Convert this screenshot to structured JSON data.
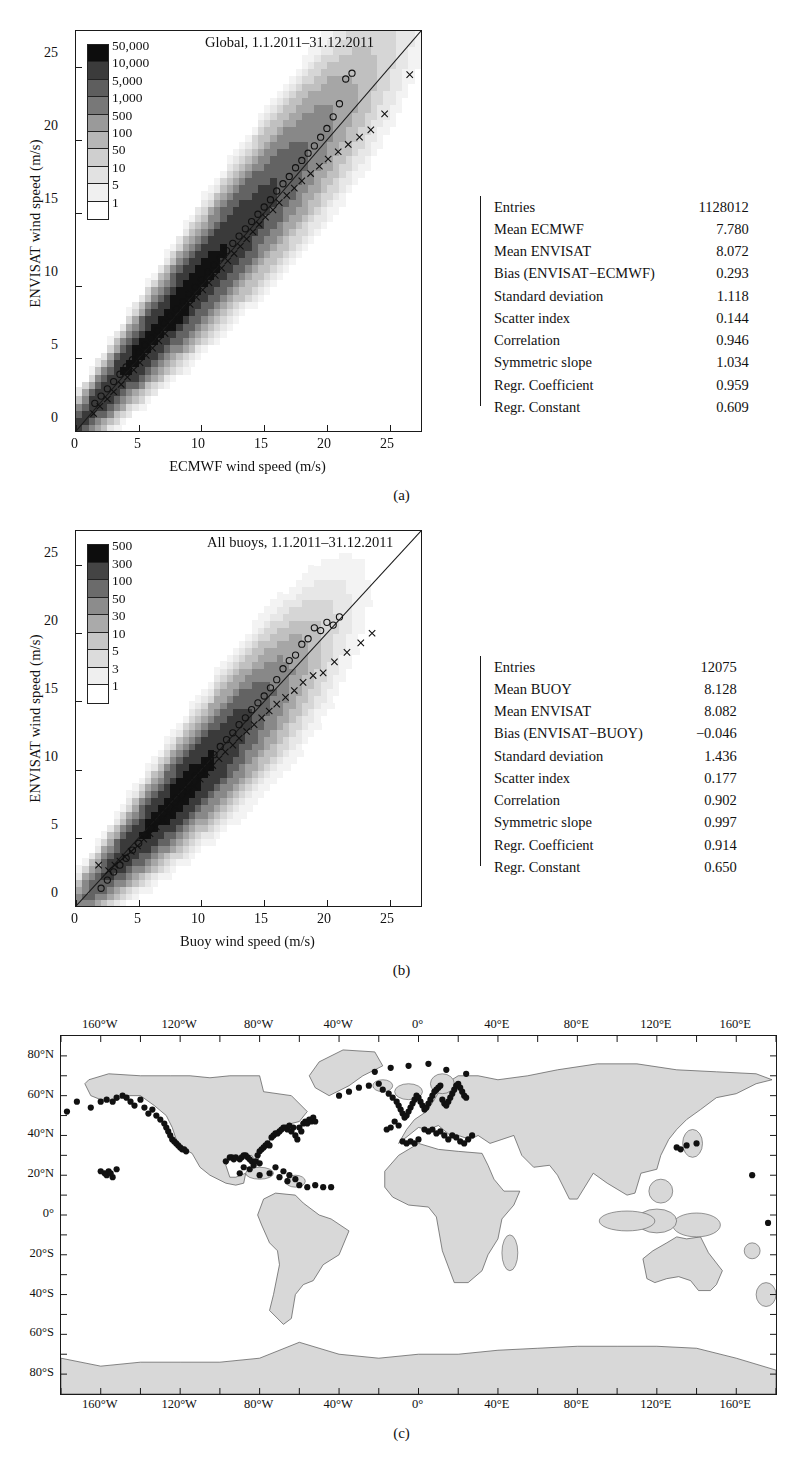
{
  "figure": {
    "panels": [
      "(a)",
      "(b)",
      "(c)"
    ]
  },
  "panel_a": {
    "caption": "(a)",
    "chart_data": {
      "type": "heatmap",
      "title": "Global, 1.1.2011–31.12.2011",
      "xlabel": "ECMWF wind speed (m/s)",
      "ylabel": "ENVISAT wind speed (m/s)",
      "xlim": [
        0,
        27.5
      ],
      "ylim": [
        0,
        27.5
      ],
      "xticks": [
        0,
        5,
        10,
        15,
        20,
        25
      ],
      "yticks": [
        0,
        5,
        10,
        15,
        20,
        25
      ],
      "grid": false,
      "colorbar": {
        "labels": [
          "50,000",
          "10,000",
          "5,000",
          "1,000",
          "500",
          "100",
          "50",
          "10",
          "5",
          "1"
        ],
        "colors": [
          "#0d0d0d",
          "#3b3b3b",
          "#5e5e5e",
          "#787878",
          "#9a9a9a",
          "#b6b6b6",
          "#cfcfcf",
          "#e2e2e2",
          "#f0f0f0",
          "#ffffff"
        ]
      },
      "reference_line": "1:1 diagonal",
      "series": [
        {
          "name": "Mean ENVISAT per ECMWF bin (open circles)",
          "marker": "circle",
          "x": [
            1.5,
            2.0,
            2.5,
            3.0,
            3.5,
            4.0,
            4.5,
            5.0,
            5.5,
            6.0,
            6.5,
            7.0,
            7.5,
            8.0,
            8.5,
            9.0,
            9.5,
            10.0,
            10.5,
            11.0,
            11.5,
            12.0,
            12.5,
            13.0,
            13.5,
            14.0,
            14.5,
            15.0,
            15.5,
            16.0,
            16.5,
            17.0,
            17.5,
            18.0,
            18.5,
            19.0,
            19.5,
            20.0,
            20.5,
            21.0,
            21.5,
            22.0
          ],
          "y": [
            1.9,
            2.4,
            2.9,
            3.4,
            3.9,
            4.4,
            4.9,
            5.4,
            5.9,
            6.4,
            6.9,
            7.4,
            7.9,
            8.4,
            8.9,
            9.4,
            9.9,
            10.4,
            10.9,
            11.4,
            11.9,
            12.4,
            12.9,
            13.4,
            13.9,
            14.4,
            14.9,
            15.4,
            15.9,
            16.5,
            17.0,
            17.5,
            18.1,
            18.6,
            19.1,
            19.6,
            20.2,
            20.8,
            21.6,
            22.5,
            24.2,
            24.6
          ]
        },
        {
          "name": "Mean ECMWF per ENVISAT bin (crosses)",
          "marker": "cross",
          "x": [
            1.4,
            1.9,
            2.5,
            3.0,
            3.6,
            4.1,
            4.6,
            5.1,
            5.6,
            6.1,
            6.6,
            7.1,
            7.6,
            8.1,
            8.6,
            9.1,
            9.6,
            10.1,
            10.6,
            11.1,
            11.6,
            12.1,
            12.6,
            13.1,
            13.6,
            14.1,
            14.6,
            15.1,
            15.7,
            16.2,
            16.8,
            17.4,
            18.0,
            18.7,
            19.4,
            20.1,
            20.9,
            21.7,
            22.6,
            23.5,
            24.6,
            26.6
          ],
          "y": [
            1.2,
            1.7,
            2.2,
            2.7,
            3.2,
            3.7,
            4.2,
            4.7,
            5.2,
            5.7,
            6.2,
            6.7,
            7.2,
            7.7,
            8.2,
            8.7,
            9.2,
            9.7,
            10.2,
            10.7,
            11.2,
            11.7,
            12.2,
            12.7,
            13.2,
            13.7,
            14.2,
            14.7,
            15.2,
            15.7,
            16.2,
            16.7,
            17.2,
            17.7,
            18.2,
            18.7,
            19.2,
            19.7,
            20.2,
            20.7,
            21.8,
            24.5
          ]
        }
      ]
    },
    "stats": {
      "rows": [
        {
          "label": "Entries",
          "value": "1128012"
        },
        {
          "label": "Mean ECMWF",
          "value": "7.780"
        },
        {
          "label": "Mean ENVISAT",
          "value": "8.072"
        },
        {
          "label": "Bias (ENVISAT−ECMWF)",
          "value": "0.293"
        },
        {
          "label": "Standard deviation",
          "value": "1.118"
        },
        {
          "label": "Scatter index",
          "value": "0.144"
        },
        {
          "label": "Correlation",
          "value": "0.946"
        },
        {
          "label": "Symmetric slope",
          "value": "1.034"
        },
        {
          "label": "Regr. Coefficient",
          "value": "0.959"
        },
        {
          "label": "Regr. Constant",
          "value": "0.609"
        }
      ]
    }
  },
  "panel_b": {
    "caption": "(b)",
    "chart_data": {
      "type": "heatmap",
      "title": "All buoys, 1.1.2011–31.12.2011",
      "xlabel": "Buoy wind speed (m/s)",
      "ylabel": "ENVISAT wind speed (m/s)",
      "xlim": [
        0,
        27.5
      ],
      "ylim": [
        0,
        27.5
      ],
      "xticks": [
        0,
        5,
        10,
        15,
        20,
        25
      ],
      "yticks": [
        0,
        5,
        10,
        15,
        20,
        25
      ],
      "grid": false,
      "colorbar": {
        "labels": [
          "500",
          "300",
          "100",
          "50",
          "30",
          "10",
          "5",
          "3",
          "1"
        ],
        "colors": [
          "#0d0d0d",
          "#444444",
          "#6b6b6b",
          "#8c8c8c",
          "#aaaaaa",
          "#c6c6c6",
          "#dcdcdc",
          "#efefef",
          "#ffffff"
        ]
      },
      "reference_line": "1:1 diagonal",
      "series": [
        {
          "name": "Mean ENVISAT per buoy bin (open circles)",
          "marker": "circle",
          "x": [
            2.0,
            2.5,
            3.0,
            3.5,
            4.0,
            4.5,
            5.0,
            5.5,
            6.0,
            6.5,
            7.0,
            7.5,
            8.0,
            8.5,
            9.0,
            9.5,
            10.0,
            10.5,
            11.0,
            11.5,
            12.0,
            12.5,
            13.0,
            13.5,
            14.0,
            14.5,
            15.0,
            15.5,
            16.0,
            16.5,
            17.0,
            17.5,
            18.0,
            18.5,
            19.0,
            19.5,
            20.0,
            20.5,
            21.0
          ],
          "y": [
            1.3,
            1.9,
            2.5,
            3.0,
            3.5,
            4.1,
            4.6,
            5.2,
            5.7,
            6.3,
            6.8,
            7.3,
            7.9,
            8.4,
            9.0,
            9.5,
            10.0,
            10.6,
            11.1,
            11.7,
            12.2,
            12.7,
            13.3,
            13.8,
            14.4,
            14.9,
            15.4,
            16.0,
            16.6,
            17.4,
            18.0,
            18.4,
            19.2,
            19.6,
            20.4,
            20.2,
            20.8,
            20.6,
            21.2
          ]
        },
        {
          "name": "Mean buoy per ENVISAT bin (crosses)",
          "marker": "cross",
          "x": [
            1.8,
            2.6,
            3.1,
            3.5,
            3.9,
            4.4,
            4.9,
            5.4,
            5.9,
            6.4,
            6.9,
            7.4,
            7.9,
            8.4,
            8.9,
            9.4,
            9.9,
            10.4,
            10.9,
            11.4,
            11.9,
            12.5,
            13.0,
            13.6,
            14.2,
            14.8,
            15.4,
            16.0,
            16.7,
            17.4,
            18.1,
            18.9,
            19.7,
            20.6,
            21.6,
            22.7,
            23.6
          ],
          "y": [
            3.0,
            2.6,
            3.0,
            3.3,
            3.6,
            4.0,
            4.4,
            4.9,
            5.3,
            5.8,
            6.3,
            6.8,
            7.3,
            7.8,
            8.3,
            8.8,
            9.3,
            9.8,
            10.3,
            10.8,
            11.3,
            11.8,
            12.3,
            12.8,
            13.3,
            13.8,
            14.3,
            14.8,
            15.3,
            15.8,
            16.4,
            16.9,
            17.1,
            17.9,
            18.6,
            19.3,
            20.0
          ]
        }
      ]
    },
    "stats": {
      "rows": [
        {
          "label": "Entries",
          "value": "12075"
        },
        {
          "label": "Mean BUOY",
          "value": "8.128"
        },
        {
          "label": "Mean ENVISAT",
          "value": "8.082"
        },
        {
          "label": "Bias (ENVISAT−BUOY)",
          "value": "−0.046"
        },
        {
          "label": "Standard deviation",
          "value": "1.436"
        },
        {
          "label": "Scatter index",
          "value": "0.177"
        },
        {
          "label": "Correlation",
          "value": "0.902"
        },
        {
          "label": "Symmetric slope",
          "value": "0.997"
        },
        {
          "label": "Regr. Coefficient",
          "value": "0.914"
        },
        {
          "label": "Regr. Constant",
          "value": "0.650"
        }
      ]
    }
  },
  "panel_c": {
    "caption": "(c)",
    "chart_data": {
      "type": "scatter",
      "title": "",
      "xlabel": "",
      "ylabel": "",
      "projection": "equirectangular",
      "xlim": [
        -180,
        180
      ],
      "ylim": [
        -90,
        90
      ],
      "lon_ticks": [
        "160°W",
        "120°W",
        "80°W",
        "40°W",
        "0°",
        "40°E",
        "80°E",
        "120°E",
        "160°E"
      ],
      "lon_tick_values": [
        -160,
        -120,
        -80,
        -40,
        0,
        40,
        80,
        120,
        160
      ],
      "lat_ticks": [
        "80°N",
        "60°N",
        "40°N",
        "20°N",
        "0°",
        "20°S",
        "40°S",
        "60°S",
        "80°S"
      ],
      "lat_tick_values": [
        80,
        60,
        40,
        20,
        0,
        -20,
        -40,
        -60,
        -80
      ],
      "land_color": "#d8d8d8",
      "ocean_color": "#ffffff",
      "marker": "filled-circle",
      "marker_color": "#111111",
      "buoy_positions": [
        [
          -177,
          52
        ],
        [
          -172,
          57
        ],
        [
          -165,
          54
        ],
        [
          -160,
          57
        ],
        [
          -157,
          58
        ],
        [
          -154,
          57
        ],
        [
          -152,
          59
        ],
        [
          -149,
          60
        ],
        [
          -147,
          59
        ],
        [
          -145,
          57
        ],
        [
          -143,
          55
        ],
        [
          -140,
          58
        ],
        [
          -138,
          54
        ],
        [
          -136,
          51
        ],
        [
          -134,
          53
        ],
        [
          -132,
          50
        ],
        [
          -130,
          48
        ],
        [
          -128,
          46
        ],
        [
          -127,
          44
        ],
        [
          -126,
          42
        ],
        [
          -125,
          40
        ],
        [
          -124,
          38
        ],
        [
          -123,
          37
        ],
        [
          -122,
          36
        ],
        [
          -121,
          35
        ],
        [
          -120,
          34
        ],
        [
          -119,
          33
        ],
        [
          -118,
          33
        ],
        [
          -117,
          32
        ],
        [
          -158,
          21
        ],
        [
          -157,
          20
        ],
        [
          -156,
          22
        ],
        [
          -154,
          19
        ],
        [
          -152,
          23
        ],
        [
          -160,
          22
        ],
        [
          -155,
          21
        ],
        [
          -97,
          27
        ],
        [
          -95,
          29
        ],
        [
          -94,
          29
        ],
        [
          -93,
          28
        ],
        [
          -92,
          29
        ],
        [
          -90,
          28
        ],
        [
          -89,
          29
        ],
        [
          -88,
          30
        ],
        [
          -87,
          30
        ],
        [
          -86,
          29
        ],
        [
          -85,
          28
        ],
        [
          -84,
          27
        ],
        [
          -83,
          25
        ],
        [
          -82,
          27
        ],
        [
          -81,
          30
        ],
        [
          -80,
          26
        ],
        [
          -80,
          32
        ],
        [
          -79,
          33
        ],
        [
          -78,
          34
        ],
        [
          -77,
          35
        ],
        [
          -76,
          36
        ],
        [
          -75,
          35
        ],
        [
          -74,
          39
        ],
        [
          -73,
          40
        ],
        [
          -72,
          41
        ],
        [
          -71,
          41
        ],
        [
          -70,
          42
        ],
        [
          -69,
          43
        ],
        [
          -68,
          44
        ],
        [
          -67,
          44
        ],
        [
          -66,
          43
        ],
        [
          -65,
          45
        ],
        [
          -64,
          42
        ],
        [
          -63,
          44
        ],
        [
          -62,
          40
        ],
        [
          -61,
          38
        ],
        [
          -60,
          44
        ],
        [
          -59,
          42
        ],
        [
          -58,
          46
        ],
        [
          -57,
          47
        ],
        [
          -56,
          46
        ],
        [
          -55,
          48
        ],
        [
          -54,
          47
        ],
        [
          -53,
          49
        ],
        [
          -52,
          47
        ],
        [
          -72,
          24
        ],
        [
          -68,
          22
        ],
        [
          -65,
          20
        ],
        [
          -62,
          18
        ],
        [
          -70,
          19
        ],
        [
          -66,
          17
        ],
        [
          -60,
          15
        ],
        [
          -56,
          14
        ],
        [
          -52,
          15
        ],
        [
          -48,
          14
        ],
        [
          -44,
          14
        ],
        [
          -85,
          23
        ],
        [
          -88,
          24
        ],
        [
          -90,
          21
        ],
        [
          -80,
          20
        ],
        [
          -75,
          21
        ],
        [
          -40,
          60
        ],
        [
          -35,
          62
        ],
        [
          -30,
          64
        ],
        [
          -25,
          65
        ],
        [
          -20,
          66
        ],
        [
          -18,
          63
        ],
        [
          -15,
          61
        ],
        [
          -13,
          59
        ],
        [
          -11,
          57
        ],
        [
          -10,
          55
        ],
        [
          -9,
          53
        ],
        [
          -8,
          51
        ],
        [
          -7,
          49
        ],
        [
          -6,
          50
        ],
        [
          -5,
          52
        ],
        [
          -4,
          54
        ],
        [
          -3,
          56
        ],
        [
          -2,
          58
        ],
        [
          -1,
          60
        ],
        [
          0,
          59
        ],
        [
          1,
          57
        ],
        [
          2,
          55
        ],
        [
          3,
          53
        ],
        [
          4,
          54
        ],
        [
          5,
          56
        ],
        [
          6,
          58
        ],
        [
          7,
          60
        ],
        [
          8,
          62
        ],
        [
          9,
          63
        ],
        [
          10,
          64
        ],
        [
          11,
          65
        ],
        [
          12,
          58
        ],
        [
          13,
          56
        ],
        [
          14,
          55
        ],
        [
          15,
          57
        ],
        [
          16,
          59
        ],
        [
          17,
          61
        ],
        [
          18,
          63
        ],
        [
          19,
          65
        ],
        [
          20,
          66
        ],
        [
          21,
          64
        ],
        [
          22,
          62
        ],
        [
          23,
          60
        ],
        [
          24,
          59
        ],
        [
          3,
          43
        ],
        [
          5,
          42
        ],
        [
          7,
          43
        ],
        [
          9,
          41
        ],
        [
          11,
          42
        ],
        [
          13,
          40
        ],
        [
          15,
          38
        ],
        [
          17,
          40
        ],
        [
          19,
          39
        ],
        [
          21,
          37
        ],
        [
          23,
          36
        ],
        [
          25,
          38
        ],
        [
          27,
          40
        ],
        [
          -8,
          37
        ],
        [
          -6,
          36
        ],
        [
          -4,
          37
        ],
        [
          -2,
          36
        ],
        [
          0,
          38
        ],
        [
          -22,
          72
        ],
        [
          -14,
          74
        ],
        [
          -5,
          75
        ],
        [
          5,
          76
        ],
        [
          14,
          73
        ],
        [
          24,
          71
        ],
        [
          -10,
          45
        ],
        [
          -12,
          47
        ],
        [
          -14,
          44
        ],
        [
          -16,
          43
        ],
        [
          130,
          34
        ],
        [
          132,
          33
        ],
        [
          135,
          35
        ],
        [
          140,
          36
        ],
        [
          168,
          20
        ],
        [
          176,
          -4
        ]
      ]
    }
  }
}
